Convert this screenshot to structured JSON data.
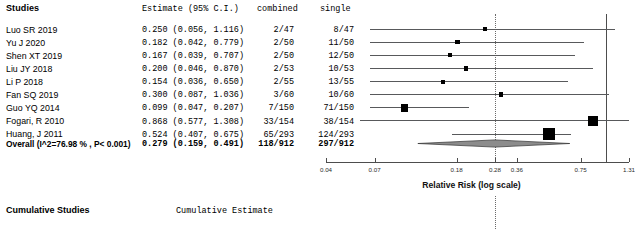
{
  "header": {
    "studies_label": "Studies",
    "estimate_label": "Estimate (95% C.I.)",
    "combined_label": "combined",
    "single_label": "single"
  },
  "footer": {
    "cumulative_studies_label": "Cumulative Studies",
    "cumulative_estimate_label": "Cumulative Estimate"
  },
  "overall": {
    "label": "Overall (I^2=76.98 % , P< 0.001)",
    "estimate_text": "0.279  (0.159,  0.491)",
    "combined": "118/912",
    "single": "297/912"
  },
  "rows": [
    {
      "study": "Luo SR 2019",
      "estimate_text": "0.250  (0.056,  1.116)",
      "combined": "2/47",
      "single": "8/47"
    },
    {
      "study": "Yu J  2020",
      "estimate_text": "0.182  (0.042,  0.779)",
      "combined": "2/50",
      "single": "11/50"
    },
    {
      "study": "Shen XT 2019",
      "estimate_text": "0.167  (0.039,  0.707)",
      "combined": "2/50",
      "single": "12/50"
    },
    {
      "study": "Liu JY  2018",
      "estimate_text": "0.200  (0.046,  0.870)",
      "combined": "2/53",
      "single": "10/53"
    },
    {
      "study": "Li P 2018",
      "estimate_text": "0.154  (0.036,  0.650)",
      "combined": "2/55",
      "single": "13/55"
    },
    {
      "study": "Fan SQ 2019",
      "estimate_text": "0.300  (0.087,  1.036)",
      "combined": "3/60",
      "single": "10/60"
    },
    {
      "study": "Guo YQ 2014",
      "estimate_text": "0.099  (0.047,  0.207)",
      "combined": "7/150",
      "single": "71/150"
    },
    {
      "study": "Fogari, R 2010",
      "estimate_text": "0.868  (0.577,  1.308)",
      "combined": "33/154",
      "single": "38/154"
    },
    {
      "study": "Huang, J 2011",
      "estimate_text": "0.524  (0.407,  0.675)",
      "combined": "65/293",
      "single": "124/293"
    }
  ],
  "chart_data": {
    "type": "forest",
    "title": "",
    "xlabel": "Relative Risk (log scale)",
    "ylabel": "",
    "scale": "log",
    "xlim": [
      0.04,
      1.31
    ],
    "tick_labels": [
      "0.04",
      "0.07",
      "0.18",
      "0.28",
      "0.36",
      "0.75",
      "1.31"
    ],
    "tick_values": [
      0.04,
      0.07,
      0.18,
      0.28,
      0.36,
      0.75,
      1.31
    ],
    "null_line": 1.0,
    "pooled_line": 0.279,
    "effect_measure": "Relative Risk",
    "heterogeneity": "I^2=76.98 %",
    "p_value": "P< 0.001",
    "grid": false,
    "studies": [
      {
        "name": "Luo SR 2019",
        "estimate": 0.25,
        "ci_low": 0.056,
        "ci_high": 1.116,
        "weight": 2.2,
        "events_combined": "2/47",
        "events_single": "8/47"
      },
      {
        "name": "Yu J  2020",
        "estimate": 0.182,
        "ci_low": 0.042,
        "ci_high": 0.779,
        "weight": 2.4,
        "events_combined": "2/50",
        "events_single": "11/50"
      },
      {
        "name": "Shen XT 2019",
        "estimate": 0.167,
        "ci_low": 0.039,
        "ci_high": 0.707,
        "weight": 2.3,
        "events_combined": "2/50",
        "events_single": "12/50"
      },
      {
        "name": "Liu JY  2018",
        "estimate": 0.2,
        "ci_low": 0.046,
        "ci_high": 0.87,
        "weight": 2.3,
        "events_combined": "2/53",
        "events_single": "10/53"
      },
      {
        "name": "Li P 2018",
        "estimate": 0.154,
        "ci_low": 0.036,
        "ci_high": 0.65,
        "weight": 2.3,
        "events_combined": "2/55",
        "events_single": "13/55"
      },
      {
        "name": "Fan SQ 2019",
        "estimate": 0.3,
        "ci_low": 0.087,
        "ci_high": 1.036,
        "weight": 3.0,
        "events_combined": "3/60",
        "events_single": "10/60"
      },
      {
        "name": "Guo YQ 2014",
        "estimate": 0.099,
        "ci_low": 0.047,
        "ci_high": 0.207,
        "weight": 6.0,
        "events_combined": "7/150",
        "events_single": "71/150"
      },
      {
        "name": "Fogari, R 2010",
        "estimate": 0.868,
        "ci_low": 0.577,
        "ci_high": 1.308,
        "weight": 9.0,
        "events_combined": "33/154",
        "events_single": "38/154"
      },
      {
        "name": "Huang, J 2011",
        "estimate": 0.524,
        "ci_low": 0.407,
        "ci_high": 0.675,
        "weight": 11.0,
        "events_combined": "65/293",
        "events_single": "124/293"
      }
    ],
    "overall": {
      "name": "Overall",
      "estimate": 0.279,
      "ci_low": 0.159,
      "ci_high": 0.491,
      "events_combined": "118/912",
      "events_single": "297/912"
    }
  }
}
